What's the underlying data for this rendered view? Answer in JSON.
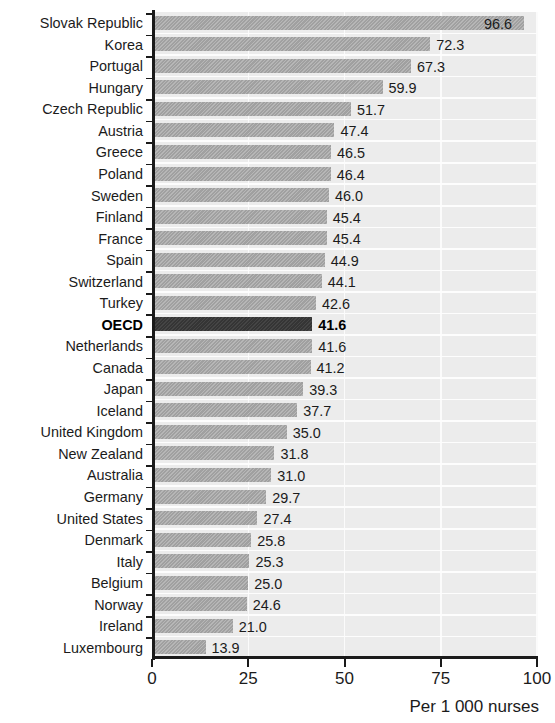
{
  "figure": {
    "title": "",
    "axis_caption": "Per 1 000 nurses",
    "highlight_category": "OECD",
    "colors": {
      "bar": "#a9a9a9",
      "bar_highlight": "#3b3b3b",
      "plot_background": "#ececec",
      "axis": "#1a1a1a",
      "gridline": "#fbfbfb",
      "text": "#1b1b1b"
    }
  },
  "chart_data": {
    "type": "bar",
    "orientation": "horizontal",
    "title": "",
    "xlabel": "Per 1 000 nurses",
    "ylabel": "",
    "xlim": [
      0,
      100
    ],
    "xticks": [
      0,
      25,
      50,
      75,
      100
    ],
    "xtick_labels": [
      "0",
      "25",
      "50",
      "75",
      "100"
    ],
    "grid": "vertical",
    "legend": "none",
    "highlight": "OECD",
    "categories": [
      "Slovak Republic",
      "Korea",
      "Portugal",
      "Hungary",
      "Czech Republic",
      "Austria",
      "Greece",
      "Poland",
      "Sweden",
      "Finland",
      "France",
      "Spain",
      "Switzerland",
      "Turkey",
      "OECD",
      "Netherlands",
      "Canada",
      "Japan",
      "Iceland",
      "United Kingdom",
      "New Zealand",
      "Australia",
      "Germany",
      "United States",
      "Denmark",
      "Italy",
      "Belgium",
      "Norway",
      "Ireland",
      "Luxembourg"
    ],
    "values": [
      96.6,
      72.3,
      67.3,
      59.9,
      51.7,
      47.4,
      46.5,
      46.4,
      46.0,
      45.4,
      45.4,
      44.9,
      44.1,
      42.6,
      41.6,
      41.6,
      41.2,
      39.3,
      37.7,
      35.0,
      31.8,
      31.0,
      29.7,
      27.4,
      25.8,
      25.3,
      25.0,
      24.6,
      21.0,
      13.9
    ],
    "value_labels": [
      "96.6",
      "72.3",
      "67.3",
      "59.9",
      "51.7",
      "47.4",
      "46.5",
      "46.4",
      "46.0",
      "45.4",
      "45.4",
      "44.9",
      "44.1",
      "42.6",
      "41.6",
      "41.6",
      "41.2",
      "39.3",
      "37.7",
      "35.0",
      "31.8",
      "31.0",
      "29.7",
      "27.4",
      "25.8",
      "25.3",
      "25.0",
      "24.6",
      "21.0",
      "13.9"
    ]
  }
}
